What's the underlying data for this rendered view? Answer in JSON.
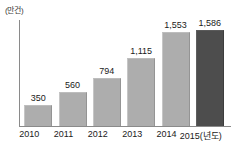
{
  "chart_data": {
    "type": "bar",
    "title": "",
    "subtitle": "",
    "xlabel": "",
    "ylabel": "",
    "unit_label": "(만건)",
    "axis_note": "2015(년도)",
    "categories": [
      "2010",
      "2011",
      "2012",
      "2013",
      "2014",
      "2015(년도)"
    ],
    "values": [
      350,
      560,
      794,
      1115,
      1553,
      1586
    ],
    "value_labels": [
      "350",
      "560",
      "794",
      "1,115",
      "1,553",
      "1,586"
    ],
    "ylim": [
      0,
      1750
    ],
    "grid": false,
    "legend": false,
    "series": [
      {
        "name": "건수",
        "values": [
          350,
          560,
          794,
          1115,
          1553,
          1586
        ]
      }
    ],
    "colors": {
      "bar": "#adadad",
      "bar_highlight": "#4d4d4d",
      "axis": "#8a8a8a",
      "text": "#1a1a1a",
      "background": "#ffffff"
    },
    "highlight_index": 5
  }
}
